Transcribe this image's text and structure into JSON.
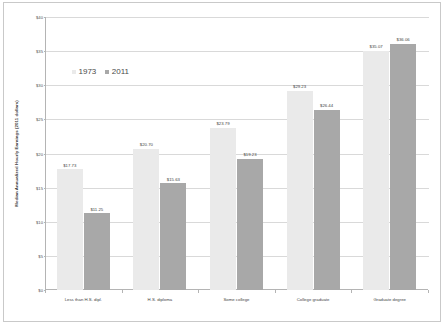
{
  "chart_data": {
    "type": "bar",
    "title": "",
    "xlabel": "",
    "ylabel": "Median Annualized Hourly Earnings (2011 dollars)",
    "ylim": [
      0,
      40
    ],
    "ytick_step": 5,
    "ytick_labels": [
      "$40",
      "$35",
      "$30",
      "$25",
      "$20",
      "$15",
      "$10",
      "$5",
      "$0"
    ],
    "ytick_values": [
      40,
      35,
      30,
      25,
      20,
      15,
      10,
      5,
      0
    ],
    "grid": true,
    "legend_position": "inside-upper-left",
    "categories": [
      "Less than H.S. dipl.",
      "H.S. diploma",
      "Some college",
      "College graduate",
      "Graduate degree"
    ],
    "series": [
      {
        "name": "1973",
        "color": "#eaeaea",
        "values": [
          17.73,
          20.7,
          23.79,
          29.23,
          35.07
        ],
        "labels": [
          "$17.73",
          "$20.70",
          "$23.79",
          "$29.23",
          "$35.07"
        ]
      },
      {
        "name": "2011",
        "color": "#a8a8a8",
        "values": [
          11.25,
          15.63,
          19.23,
          26.44,
          36.06
        ],
        "labels": [
          "$11.25",
          "$15.63",
          "$19.23",
          "$26.44",
          "$36.06"
        ]
      }
    ]
  }
}
